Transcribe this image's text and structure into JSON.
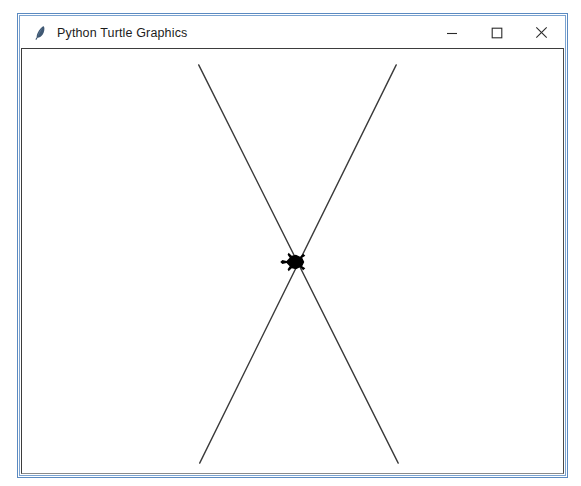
{
  "window": {
    "title": "Python Turtle Graphics",
    "icon": "python-feather-icon",
    "border_color": "#5b8ac1",
    "title_bar_background": "#ffffff",
    "controls": [
      {
        "name": "minimize",
        "glyph": "−",
        "label": "Minimize"
      },
      {
        "name": "maximize",
        "glyph": "□",
        "label": "Maximize"
      },
      {
        "name": "close",
        "glyph": "×",
        "label": "Close"
      }
    ]
  },
  "canvas": {
    "background": "#ffffff",
    "border_color": "#3d3d3d",
    "stroke_color": "#3a3a3a",
    "stroke_width": 1.4,
    "turtle": {
      "name": "turtle-cursor",
      "color": "#000000",
      "x": 298,
      "y": 263,
      "heading_degrees": 0,
      "shape": "turtle"
    },
    "drawing": {
      "description": "Two crossing straight lines forming an X",
      "lines": [
        {
          "name": "line-top-left-to-bottom-right",
          "x1": 199,
          "y1": 64,
          "x2": 400,
          "y2": 466
        },
        {
          "name": "line-top-right-to-bottom-left",
          "x1": 398,
          "y1": 64,
          "x2": 200,
          "y2": 466
        }
      ],
      "intersection": {
        "x": 298,
        "y": 263
      }
    }
  }
}
